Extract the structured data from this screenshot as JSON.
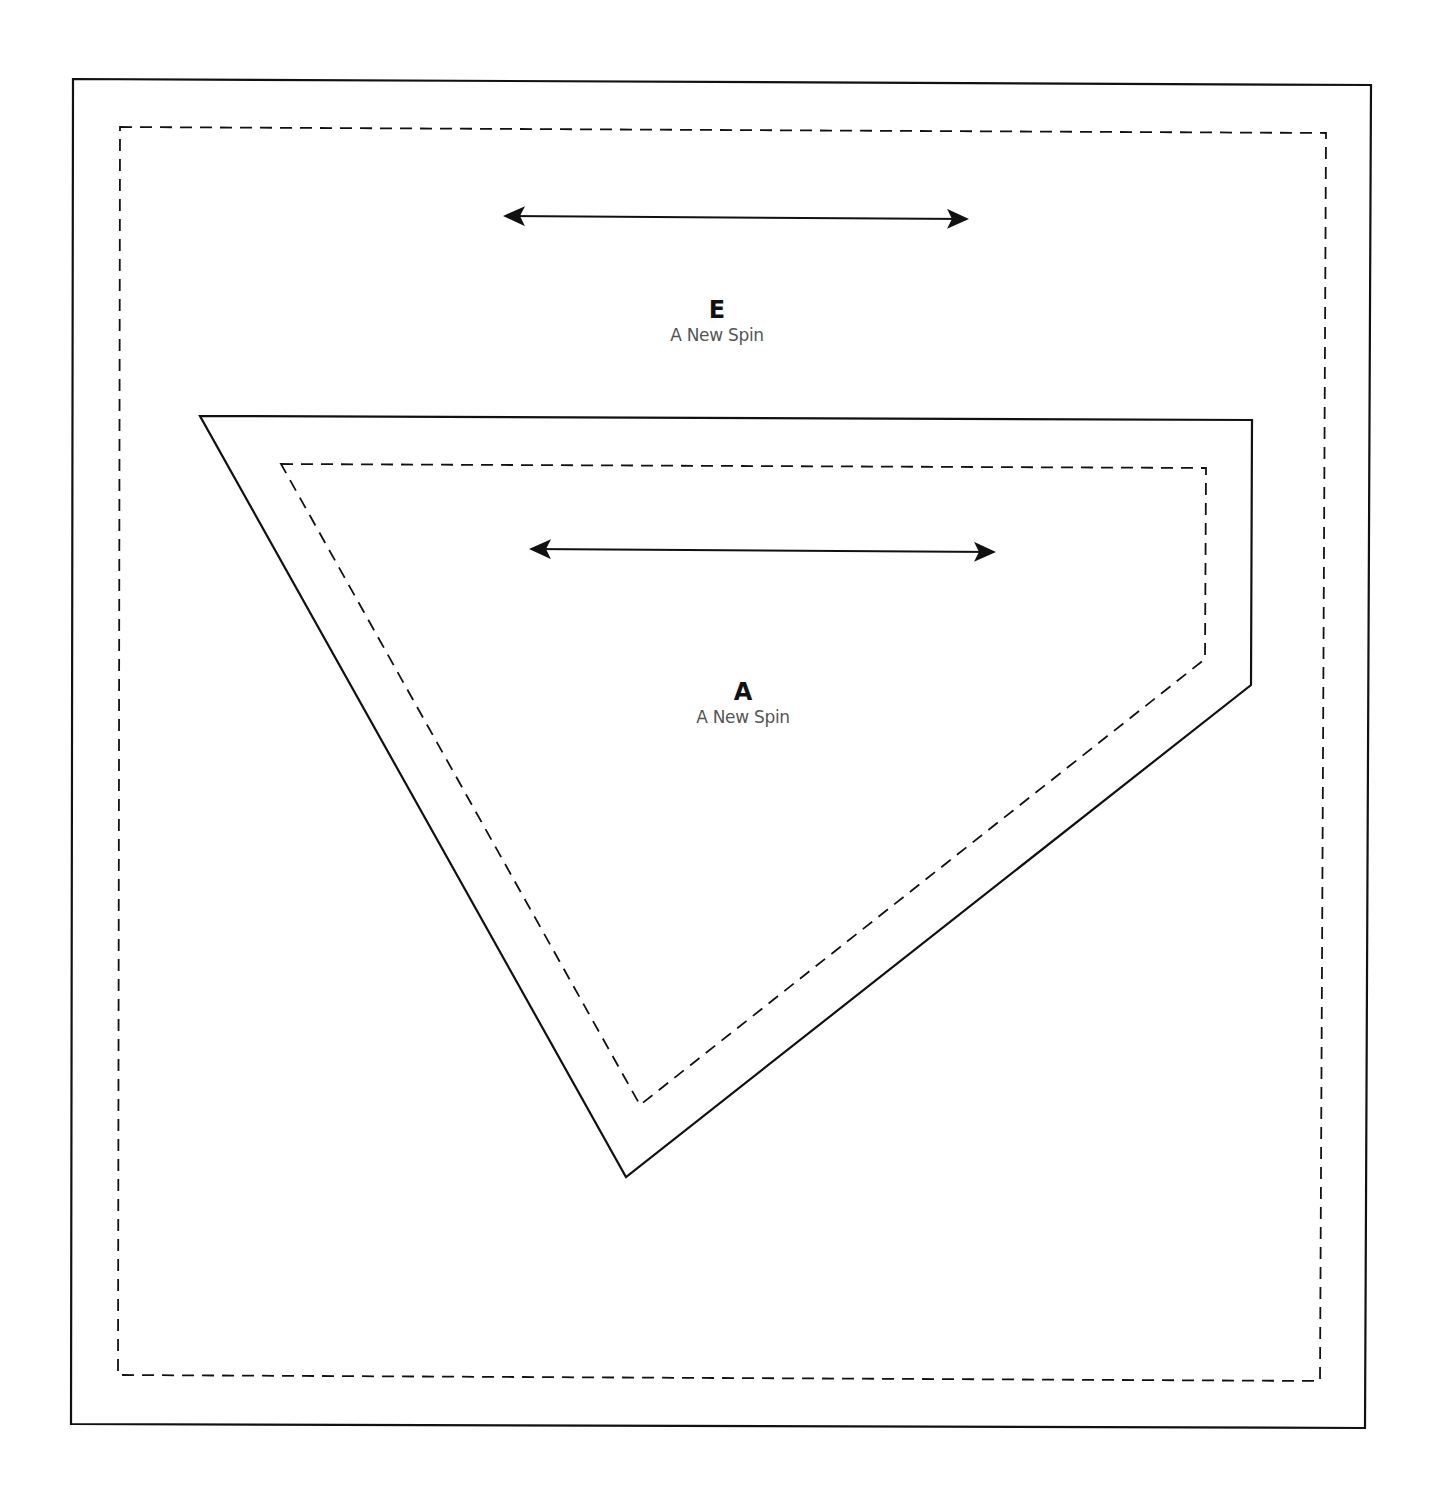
{
  "template": {
    "pieces": [
      {
        "id": "E",
        "letter": "E",
        "pattern_name": "A New Spin",
        "cut_outline": [
          [
            73,
            79
          ],
          [
            1371,
            85
          ],
          [
            1365,
            1428
          ],
          [
            71,
            1424
          ]
        ],
        "seam_line": [
          [
            120,
            127
          ],
          [
            1326,
            133
          ],
          [
            1320,
            1381
          ],
          [
            118,
            1375
          ]
        ],
        "grain_arrow": {
          "x1": 505,
          "y1": 216,
          "x2": 967,
          "y2": 219
        },
        "label_position": {
          "x": 717,
          "y": 296
        }
      },
      {
        "id": "A",
        "letter": "A",
        "pattern_name": "A New Spin",
        "cut_outline": [
          [
            200,
            416
          ],
          [
            1252,
            420
          ],
          [
            1251,
            685
          ],
          [
            626,
            1177
          ]
        ],
        "seam_line": [
          [
            281,
            464
          ],
          [
            1206,
            468
          ],
          [
            1205,
            659
          ],
          [
            640,
            1105
          ]
        ],
        "grain_arrow": {
          "x1": 531,
          "y1": 549,
          "x2": 994,
          "y2": 552
        },
        "label_position": {
          "x": 743,
          "y": 678
        }
      }
    ],
    "legend": {
      "solid_line": "cutting line",
      "dashed_line": "seam line",
      "arrow": "grain line"
    }
  },
  "colors": {
    "line": "#111111",
    "text_primary": "#111111",
    "text_secondary": "#555555",
    "background": "#ffffff"
  }
}
